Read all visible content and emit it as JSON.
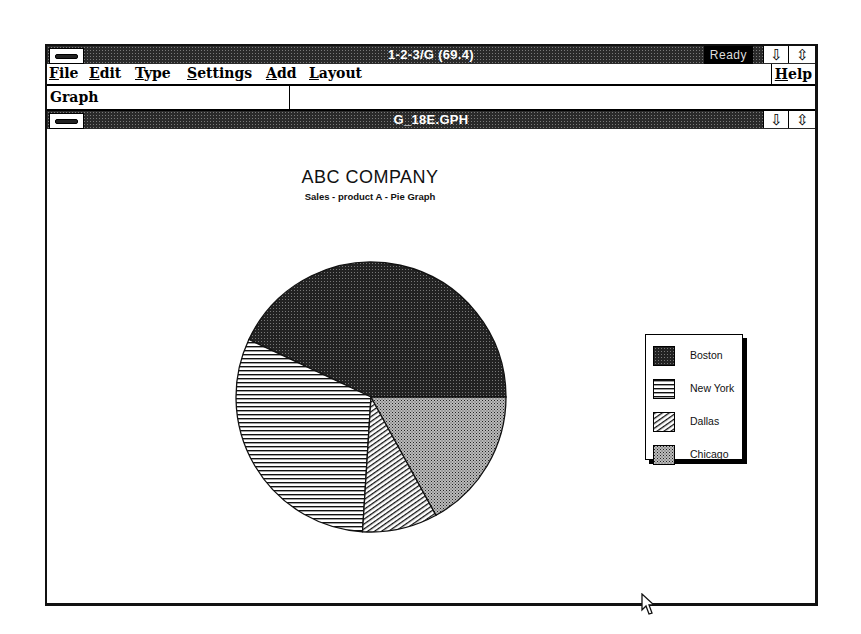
{
  "app": {
    "title": "1-2-3/G (69.4)",
    "status": "Ready",
    "minimize_glyph": "⇩",
    "restore_glyph": "⇳"
  },
  "menu": {
    "items": [
      {
        "label": "File",
        "accel": "F"
      },
      {
        "label": "Edit",
        "accel": "E"
      },
      {
        "label": "Type",
        "accel": "T"
      },
      {
        "label": "Settings",
        "accel": "S"
      },
      {
        "label": "Add",
        "accel": "A"
      },
      {
        "label": "Layout",
        "accel": "L"
      }
    ],
    "help": "Help"
  },
  "mode_bar": {
    "label": "Graph"
  },
  "document": {
    "title": "G_18E.GPH"
  },
  "chart_data": {
    "type": "pie",
    "title": "ABC COMPANY",
    "subtitle": "Sales - product A  - Pie Graph",
    "categories": [
      "Boston",
      "New York",
      "Dallas",
      "Chicago"
    ],
    "values": [
      43,
      31,
      9,
      17
    ],
    "patterns": [
      "dense-dots",
      "horizontal-lines",
      "diagonal-lines",
      "crosshatch"
    ],
    "start_angle_deg": 0,
    "direction": "counter-clockwise",
    "legend_position": "right"
  }
}
